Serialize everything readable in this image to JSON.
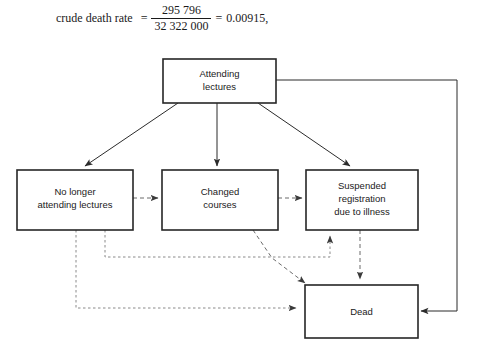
{
  "formula": {
    "label": "crude death rate",
    "equals_1": "=",
    "numerator": "295 796",
    "denominator": "32 322 000",
    "equals_2": "=",
    "result": "0.00915,"
  },
  "diagram": {
    "type": "state-transition-flowchart",
    "nodes": [
      {
        "id": "attending",
        "label_lines": [
          "Attending",
          "lectures"
        ]
      },
      {
        "id": "no-longer-attending",
        "label_lines": [
          "No longer",
          "attending lectures"
        ]
      },
      {
        "id": "changed-courses",
        "label_lines": [
          "Changed",
          "courses"
        ]
      },
      {
        "id": "suspended",
        "label_lines": [
          "Suspended",
          "registration",
          "due to illness"
        ]
      },
      {
        "id": "dead",
        "label_lines": [
          "Dead"
        ]
      }
    ],
    "edges": [
      {
        "from": "attending",
        "to": "no-longer-attending",
        "style": "solid"
      },
      {
        "from": "attending",
        "to": "changed-courses",
        "style": "solid"
      },
      {
        "from": "attending",
        "to": "suspended",
        "style": "solid"
      },
      {
        "from": "attending",
        "to": "dead",
        "style": "solid"
      },
      {
        "from": "no-longer-attending",
        "to": "changed-courses",
        "style": "dashed"
      },
      {
        "from": "changed-courses",
        "to": "suspended",
        "style": "dashed"
      },
      {
        "from": "no-longer-attending",
        "to": "dead",
        "style": "dashed"
      },
      {
        "from": "no-longer-attending",
        "to": "suspended",
        "style": "dashed"
      },
      {
        "from": "changed-courses",
        "to": "dead",
        "style": "dashed"
      },
      {
        "from": "suspended",
        "to": "dead",
        "style": "dashed"
      }
    ],
    "colors": {
      "box_stroke": "#262626",
      "box_fill": "#ffffff",
      "solid_edge": "#2b2b2b",
      "dashed_edge": "#6b6b6b",
      "text": "#1a1a1a",
      "background": "#ffffff"
    }
  }
}
